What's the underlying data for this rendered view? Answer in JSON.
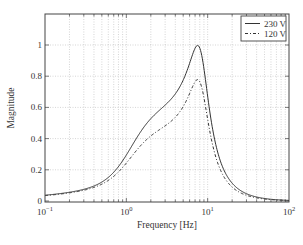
{
  "chart_data": {
    "type": "line",
    "title": "",
    "xlabel": "Frequency [Hz]",
    "ylabel": "Magnitude",
    "xscale": "log",
    "xlim": [
      0.1,
      100
    ],
    "ylim": [
      0,
      1.2
    ],
    "grid": true,
    "legend_position": "upper right",
    "x_ticks": [
      {
        "value": 0.1,
        "base": "10",
        "exp": "−1"
      },
      {
        "value": 1,
        "base": "10",
        "exp": "0"
      },
      {
        "value": 10,
        "base": "10",
        "exp": "1"
      },
      {
        "value": 100,
        "base": "10",
        "exp": "2"
      }
    ],
    "y_ticks": [
      0,
      0.2,
      0.4,
      0.6,
      0.8,
      1
    ],
    "y_tick_labels": [
      "0",
      "0.2",
      "0.4",
      "0.6",
      "0.8",
      "1"
    ],
    "series": [
      {
        "name": "230 V",
        "style": "solid",
        "peak_frequency": 8.3,
        "peak_magnitude": 1.0,
        "damping": 0.3,
        "x": [
          0.1,
          0.2,
          0.5,
          1,
          2,
          3,
          5,
          7,
          8.3,
          10,
          15,
          20,
          30,
          50,
          100
        ],
        "values": [
          0.02,
          0.035,
          0.07,
          0.14,
          0.28,
          0.4,
          0.65,
          0.9,
          1.0,
          0.93,
          0.5,
          0.28,
          0.13,
          0.05,
          0.012
        ]
      },
      {
        "name": "120 V",
        "style": "dashed",
        "peak_frequency": 8.3,
        "peak_magnitude": 0.78,
        "damping": 0.3,
        "x": [
          0.1,
          0.2,
          0.5,
          1,
          2,
          3,
          5,
          7,
          8.3,
          10,
          15,
          20,
          30,
          50,
          100
        ],
        "values": [
          0.018,
          0.032,
          0.065,
          0.13,
          0.25,
          0.34,
          0.53,
          0.71,
          0.78,
          0.72,
          0.4,
          0.22,
          0.1,
          0.04,
          0.01
        ]
      }
    ]
  },
  "colors": {
    "axis": "#444444",
    "grid": "#b8b8b8",
    "line": "#333333"
  }
}
